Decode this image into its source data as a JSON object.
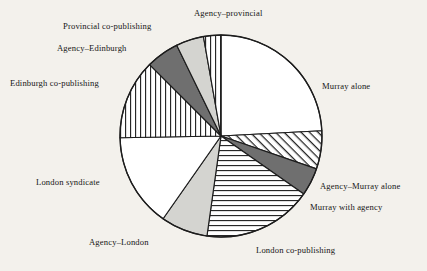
{
  "chart_data": {
    "type": "pie",
    "title": "",
    "subtitle": "",
    "xlabel": "",
    "ylabel": "",
    "legend_position": "none",
    "grid": false,
    "labels_outside": true,
    "start_angle_deg": 0,
    "direction": "clockwise",
    "units": "percent",
    "categories": [
      "Murray alone",
      "Agency–Murray alone",
      "Murray with agency",
      "London  co-publishing",
      "Agency–London",
      "London syndicate",
      "Edinburgh co-publishing",
      "Agency–Edinburgh",
      "Provincial co-publishing",
      "Agency–provincial"
    ],
    "values": [
      24.2,
      6.1,
      4.4,
      17.5,
      7.5,
      15.0,
      12.8,
      5.3,
      4.4,
      2.8
    ],
    "slices": [
      {
        "label": "Murray alone",
        "value": 24.2,
        "start_deg": 0,
        "end_deg": 87,
        "fill": "white",
        "pattern": "none",
        "color": "#ffffff",
        "label_pos": "right"
      },
      {
        "label": "Agency–Murray alone",
        "value": 6.1,
        "start_deg": 87,
        "end_deg": 109,
        "fill": "hatch",
        "pattern": "diagonal-hatch",
        "color": "#ffffff",
        "label_pos": "right"
      },
      {
        "label": "Murray with agency",
        "value": 4.4,
        "start_deg": 109,
        "end_deg": 125,
        "fill": "dark",
        "pattern": "solid-dark-gray",
        "color": "#6f6f6f",
        "label_pos": "right"
      },
      {
        "label": "London  co-publishing",
        "value": 17.5,
        "start_deg": 125,
        "end_deg": 188,
        "fill": "hstripe",
        "pattern": "horizontal-stripes",
        "color": "#ffffff",
        "label_pos": "bottom"
      },
      {
        "label": "Agency–London",
        "value": 7.5,
        "start_deg": 188,
        "end_deg": 215,
        "fill": "light",
        "pattern": "solid-light-gray",
        "color": "#d4d4d0",
        "label_pos": "bottom-left"
      },
      {
        "label": "London syndicate",
        "value": 15.0,
        "start_deg": 215,
        "end_deg": 269,
        "fill": "white",
        "pattern": "none",
        "color": "#ffffff",
        "label_pos": "left"
      },
      {
        "label": "Edinburgh co-publishing",
        "value": 12.8,
        "start_deg": 269,
        "end_deg": 315,
        "fill": "vstripe",
        "pattern": "vertical-stripes",
        "color": "#ffffff",
        "label_pos": "left"
      },
      {
        "label": "Agency–Edinburgh",
        "value": 5.3,
        "start_deg": 315,
        "end_deg": 334,
        "fill": "dark",
        "pattern": "solid-dark-gray",
        "color": "#6f6f6f",
        "label_pos": "top-left"
      },
      {
        "label": "Provincial co-publishing",
        "value": 4.4,
        "start_deg": 334,
        "end_deg": 350,
        "fill": "light",
        "pattern": "solid-light-gray",
        "color": "#d4d4d0",
        "label_pos": "top-left"
      },
      {
        "label": "Agency–provincial",
        "value": 2.8,
        "start_deg": 350,
        "end_deg": 360,
        "fill": "vstripe",
        "pattern": "vertical-stripes",
        "color": "#ffffff",
        "label_pos": "top"
      }
    ],
    "geometry": {
      "center_x": 221,
      "center_y": 136,
      "radius": 101
    },
    "colors": {
      "background": "#f3f1ec",
      "outline": "#1d1d1d",
      "dark_gray": "#6f6f6f",
      "light_gray": "#d4d4d0",
      "white": "#ffffff",
      "text": "#161616"
    }
  },
  "labels": {
    "murray_alone": "Murray alone",
    "agency_murray_alone": "Agency–Murray alone",
    "murray_with_agency": "Murray with agency",
    "london_co_publishing": "London  co-publishing",
    "agency_london": "Agency–London",
    "london_syndicate": "London syndicate",
    "edinburgh_co_publishing": "Edinburgh co-publishing",
    "agency_edinburgh": "Agency–Edinburgh",
    "provincial_co_publishing": "Provincial co-publishing",
    "agency_provincial": "Agency–provincial"
  }
}
